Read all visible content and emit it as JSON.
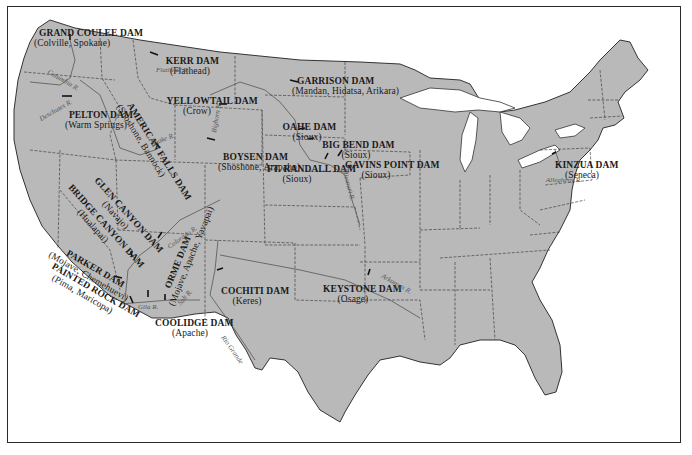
{
  "map": {
    "title": "Dams on Indian Lands in the United States",
    "land_color": "#b9b9b9",
    "water_color": "#ffffff",
    "border_color": "#2a2a2a",
    "dams": [
      {
        "name": "GRAND COULEE DAM",
        "tribes": "(Colville, Spokane)"
      },
      {
        "name": "KERR DAM",
        "tribes": "(Flathead)"
      },
      {
        "name": "AMERICAN FALLS DAM",
        "tribes": "(Shoshone, Bannock)"
      },
      {
        "name": "PELTON DAM",
        "tribes": "(Warm Springs)"
      },
      {
        "name": "YELLOWTAIL DAM",
        "tribes": "(Crow)"
      },
      {
        "name": "BOYSEN DAM",
        "tribes": "(Shoshone, Arapaho)"
      },
      {
        "name": "GARRISON DAM",
        "tribes": "(Mandan, Hidatsa, Arikara)"
      },
      {
        "name": "OAHE DAM",
        "tribes": "(Sioux)"
      },
      {
        "name": "BIG BEND DAM",
        "tribes": "(Sioux)"
      },
      {
        "name": "FT. RANDALL DAM",
        "tribes": "(Sioux)"
      },
      {
        "name": "GAVINS POINT DAM",
        "tribes": "(Sioux)"
      },
      {
        "name": "GLEN CANYON DAM",
        "tribes": "(Navajo)"
      },
      {
        "name": "BRIDGE CANYON DAM",
        "tribes": "(Hualapai)"
      },
      {
        "name": "PARKER DAM",
        "tribes": "(Mojave, Chemehuevi)"
      },
      {
        "name": "PAINTED ROCK DAM",
        "tribes": "(Pima, Maricopa)"
      },
      {
        "name": "ORME DAM",
        "tribes": "(Mojave, Apache, Yavapai)"
      },
      {
        "name": "COOLIDGE DAM",
        "tribes": "(Apache)"
      },
      {
        "name": "COCHITI DAM",
        "tribes": "(Keres)"
      },
      {
        "name": "KEYSTONE DAM",
        "tribes": "(Osage)"
      },
      {
        "name": "KINZUA DAM",
        "tribes": "(Seneca)"
      }
    ],
    "rivers": {
      "flathead": "Flathead R.",
      "columbia": "Columbia R.",
      "deschutes": "Deschutes R.",
      "snake": "Snake R.",
      "bighorn": "Bighorn R.",
      "missouri": "Missouri R.",
      "colorado": "Colorado R.",
      "gila": "Gila R.",
      "salt": "Salt R.",
      "rio_grande": "Rio Grande",
      "arkansas": "Arkansas R.",
      "allegheny": "Allegheny R."
    }
  }
}
